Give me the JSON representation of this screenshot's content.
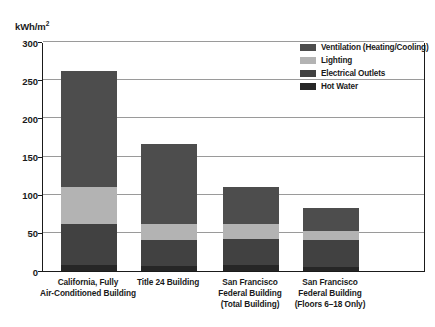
{
  "chart_data": {
    "type": "bar",
    "stacked": true,
    "title": "",
    "subtitle": "",
    "xlabel": "",
    "ylabel": "kWh/m²",
    "ylim": [
      0,
      300
    ],
    "ytick_values": [
      0,
      50,
      100,
      150,
      200,
      250,
      300
    ],
    "ytick_labels": [
      "0",
      "50",
      "100",
      "150",
      "200",
      "250",
      "300"
    ],
    "grid": true,
    "legend_position": "top-right",
    "categories": [
      "California, Fully Air-Conditioned Building",
      "Title 24 Building",
      "San Francisco Federal Building (Total Building)",
      "San Francisco Federal Building (Floors 6–18 Only)"
    ],
    "category_lines": [
      [
        "California, Fully",
        "Air-Conditioned Building"
      ],
      [
        "Title 24 Building"
      ],
      [
        "San Francisco",
        "Federal Building",
        "(Total Building)"
      ],
      [
        "San Francisco",
        "Federal Building",
        "(Floors 6–18 Only)"
      ]
    ],
    "series": [
      {
        "name": "Ventilation (Heating/Cooling)",
        "color": "#4d4d4d",
        "values": [
          152,
          104,
          48,
          30
        ]
      },
      {
        "name": "Lighting",
        "color": "#b3b3b3",
        "values": [
          48,
          22,
          20,
          12
        ]
      },
      {
        "name": "Electrical Outlets",
        "color": "#414141",
        "values": [
          54,
          34,
          34,
          35
        ]
      },
      {
        "name": "Hot Water",
        "color": "#262626",
        "values": [
          8,
          6,
          8,
          5
        ]
      }
    ],
    "totals": [
      262,
      166,
      110,
      82
    ]
  },
  "legend": {
    "items": [
      {
        "label": "Ventilation (Heating/Cooling)",
        "color": "#4d4d4d"
      },
      {
        "label": "Lighting",
        "color": "#b3b3b3"
      },
      {
        "label": "Electrical Outlets",
        "color": "#414141"
      },
      {
        "label": "Hot Water",
        "color": "#262626"
      }
    ]
  },
  "axis": {
    "y_unit_main": "kWh/m",
    "y_unit_sup": "2"
  }
}
